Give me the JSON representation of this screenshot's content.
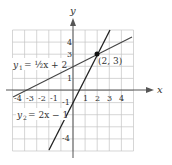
{
  "axes": {
    "x_label": "x",
    "y_label": "y"
  },
  "x_ticks": [
    "-4",
    "-3",
    "-2",
    "-1",
    "1",
    "2",
    "3",
    "4"
  ],
  "y_ticks": [
    "4",
    "3",
    "1",
    "-1",
    "-4"
  ],
  "lines": [
    {
      "label_lhs": "y",
      "label_sub": "1",
      "label_rhs": "= ½x + 2",
      "slope": 0.5,
      "intercept": 2
    },
    {
      "label_lhs": "y",
      "label_sub": "2",
      "label_rhs": "= 2x − 1",
      "slope": 2,
      "intercept": -1
    }
  ],
  "intersection": {
    "label": "(2, 3)",
    "x": 2,
    "y": 3
  },
  "colors": {
    "grid": "#bbbbbb",
    "axis": "#555555",
    "line": "#333333"
  }
}
